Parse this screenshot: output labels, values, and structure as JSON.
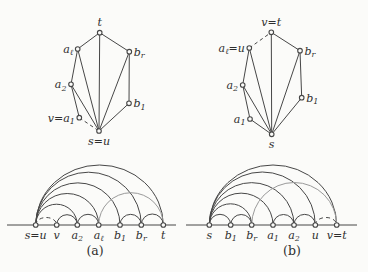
{
  "figure": {
    "background": "#fbfbf9",
    "ink": "#474747",
    "light_ink": "#9a9a9a",
    "node_fill": "#fbfbf9",
    "subfigures": [
      {
        "caption": "(a)",
        "caption_x": 95,
        "caption_y": 255,
        "top_graph": {
          "nodes": [
            {
              "id": "t",
              "label": "t",
              "x": 99.7,
              "y": 32.7,
              "side": "above"
            },
            {
              "id": "al",
              "label": "a_ℓ",
              "x": 77.7,
              "y": 49,
              "side": "left"
            },
            {
              "id": "br",
              "label": "b_r",
              "x": 129.3,
              "y": 51.7,
              "side": "right"
            },
            {
              "id": "a2",
              "label": "a_2",
              "x": 71,
              "y": 84.3,
              "side": "left"
            },
            {
              "id": "b1",
              "label": "b_1",
              "x": 129,
              "y": 103.3,
              "side": "right"
            },
            {
              "id": "v",
              "label": "v=a_1",
              "x": 79.3,
              "y": 117.7,
              "side": "left"
            },
            {
              "id": "s",
              "label": "s=u",
              "x": 99,
              "y": 131,
              "side": "below"
            }
          ],
          "edges": [
            {
              "from": "t",
              "to": "al"
            },
            {
              "from": "t",
              "to": "br"
            },
            {
              "from": "t",
              "to": "s"
            },
            {
              "from": "al",
              "to": "a2"
            },
            {
              "from": "al",
              "to": "s"
            },
            {
              "from": "br",
              "to": "b1"
            },
            {
              "from": "br",
              "to": "s"
            },
            {
              "from": "a2",
              "to": "v"
            },
            {
              "from": "a2",
              "to": "s"
            },
            {
              "from": "b1",
              "to": "s"
            },
            {
              "from": "v",
              "to": "s",
              "dashed": true
            }
          ]
        },
        "arc_diagram": {
          "baseline_y": 225,
          "line_x1": 7,
          "line_x2": 176,
          "points": [
            {
              "id": "s",
              "label": "s=u",
              "x": 35.7
            },
            {
              "id": "v",
              "label": "v",
              "x": 56.7
            },
            {
              "id": "a2",
              "label": "a_2",
              "x": 77.3
            },
            {
              "id": "al",
              "label": "a_ℓ",
              "x": 98.7
            },
            {
              "id": "b1",
              "label": "b_1",
              "x": 120
            },
            {
              "id": "br",
              "label": "b_r",
              "x": 141.3
            },
            {
              "id": "t",
              "label": "t",
              "x": 163.3
            }
          ],
          "arcs": [
            {
              "from": "s",
              "to": "v",
              "dashed": true,
              "flat": true
            },
            {
              "from": "s",
              "to": "a2"
            },
            {
              "from": "s",
              "to": "al"
            },
            {
              "from": "s",
              "to": "b1"
            },
            {
              "from": "s",
              "to": "br"
            },
            {
              "from": "s",
              "to": "t"
            },
            {
              "from": "v",
              "to": "a2"
            },
            {
              "from": "a2",
              "to": "al"
            },
            {
              "from": "al",
              "to": "t",
              "light": true
            },
            {
              "from": "b1",
              "to": "br"
            },
            {
              "from": "br",
              "to": "t"
            }
          ]
        }
      },
      {
        "caption": "(b)",
        "caption_x": 292,
        "caption_y": 255,
        "top_graph": {
          "nodes": [
            {
              "id": "t",
              "label": "v=t",
              "x": 271.3,
              "y": 32.3,
              "side": "above"
            },
            {
              "id": "u",
              "label": "a_ℓ=u",
              "x": 249.3,
              "y": 48,
              "side": "left"
            },
            {
              "id": "br",
              "label": "b_r",
              "x": 300,
              "y": 50.7,
              "side": "right"
            },
            {
              "id": "a2",
              "label": "a_2",
              "x": 242.7,
              "y": 85,
              "side": "left"
            },
            {
              "id": "b1",
              "label": "b_1",
              "x": 301.7,
              "y": 97.7,
              "side": "right"
            },
            {
              "id": "a1",
              "label": "a_1",
              "x": 250,
              "y": 119,
              "side": "left"
            },
            {
              "id": "s",
              "label": "s",
              "x": 271.7,
              "y": 134.3,
              "side": "below"
            }
          ],
          "edges": [
            {
              "from": "t",
              "to": "br"
            },
            {
              "from": "t",
              "to": "s"
            },
            {
              "from": "u",
              "to": "a2"
            },
            {
              "from": "u",
              "to": "s"
            },
            {
              "from": "u",
              "to": "t",
              "dashed": true
            },
            {
              "from": "br",
              "to": "b1"
            },
            {
              "from": "br",
              "to": "s"
            },
            {
              "from": "a2",
              "to": "a1"
            },
            {
              "from": "a2",
              "to": "s"
            },
            {
              "from": "a1",
              "to": "s"
            },
            {
              "from": "b1",
              "to": "s"
            }
          ]
        },
        "arc_diagram": {
          "baseline_y": 225,
          "line_x1": 186,
          "line_x2": 357,
          "points": [
            {
              "id": "s",
              "label": "s",
              "x": 209.3
            },
            {
              "id": "b1",
              "label": "b_1",
              "x": 230.7
            },
            {
              "id": "br",
              "label": "b_r",
              "x": 251.7
            },
            {
              "id": "a1",
              "label": "a_1",
              "x": 273
            },
            {
              "id": "a2",
              "label": "a_2",
              "x": 294
            },
            {
              "id": "u",
              "label": "u",
              "x": 315.3
            },
            {
              "id": "t",
              "label": "v=t",
              "x": 336.7
            }
          ],
          "arcs": [
            {
              "from": "s",
              "to": "b1"
            },
            {
              "from": "s",
              "to": "br"
            },
            {
              "from": "s",
              "to": "a1"
            },
            {
              "from": "s",
              "to": "a2"
            },
            {
              "from": "s",
              "to": "u"
            },
            {
              "from": "s",
              "to": "t"
            },
            {
              "from": "b1",
              "to": "br"
            },
            {
              "from": "br",
              "to": "t",
              "light": true
            },
            {
              "from": "a1",
              "to": "a2"
            },
            {
              "from": "a2",
              "to": "u"
            },
            {
              "from": "u",
              "to": "t",
              "dashed": true,
              "flat": true
            }
          ]
        }
      }
    ]
  }
}
